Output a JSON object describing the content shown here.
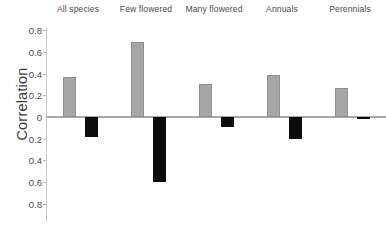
{
  "chart_data": {
    "type": "bar",
    "title": "",
    "subtitle": "",
    "xlabel": "",
    "ylabel": "Correlation",
    "categories": [
      "All species",
      "Few flowered",
      "Many flowered",
      "Annuals",
      "Perennials"
    ],
    "series": [
      {
        "name": "positive-series",
        "color": "#a6a6a6",
        "values": [
          0.37,
          0.69,
          0.3,
          0.39,
          0.27
        ]
      },
      {
        "name": "negative-series",
        "color": "#0d0d0d",
        "values": [
          -0.18,
          -0.6,
          -0.09,
          -0.2,
          -0.02
        ]
      }
    ],
    "ylim": [
      -0.8,
      0.8
    ],
    "yticks": [
      0.8,
      0.6,
      0.4,
      0.2,
      0.0,
      -0.2,
      -0.4,
      -0.6,
      -0.8
    ],
    "ytick_labels": [
      "0.8",
      "0.6",
      "0.4",
      "0.2",
      "0",
      "0.2",
      "0.4",
      "0.6",
      "0.8"
    ],
    "grid": false,
    "legend": "none",
    "category_label_position": "top",
    "zero_line": true
  },
  "axis": {
    "y_title": "Correlation"
  },
  "colors": {
    "series_positive": "#a6a6a6",
    "series_negative": "#0d0d0d",
    "axis_line": "#a8a8a8",
    "tick_text": "#4b4b4b",
    "background": "#ffffff"
  }
}
